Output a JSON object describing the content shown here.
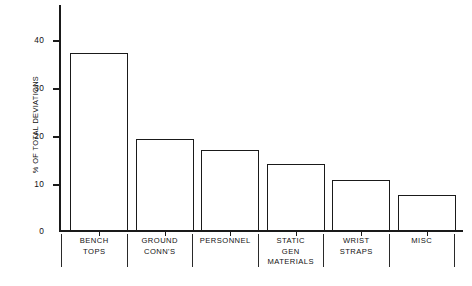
{
  "chart_data": {
    "type": "bar",
    "title": "",
    "subtitle": "",
    "xlabel": "",
    "ylabel": "% OF TOTAL DEVIATIONS",
    "ylim": [
      0,
      46
    ],
    "yticks": [
      0,
      10,
      20,
      30,
      40
    ],
    "ytick_labels": [
      "0",
      "10",
      "20",
      "30",
      "40"
    ],
    "grid": false,
    "legend": null,
    "categories": [
      "BENCH TOPS",
      "GROUND CONN'S",
      "PERSONNEL",
      "STATIC GEN MATERIALS",
      "WRIST STRAPS",
      "MISC"
    ],
    "category_lines": [
      [
        "BENCH",
        "TOPS"
      ],
      [
        "GROUND",
        "CONN'S"
      ],
      [
        "PERSONNEL"
      ],
      [
        "STATIC",
        "GEN",
        "MATERIALS"
      ],
      [
        "WRIST",
        "STRAPS"
      ],
      [
        "MISC"
      ]
    ],
    "values": [
      36.9,
      18.9,
      16.6,
      13.7,
      10.4,
      7.3
    ],
    "bar_fill": "#ffffff",
    "bar_edge": "#1a1a1a",
    "axis_color": "#1a1a1a",
    "background": "#ffffff"
  }
}
